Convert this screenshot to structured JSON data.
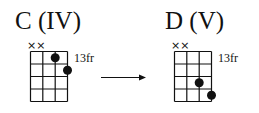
{
  "diagrams": [
    {
      "title": "C (IV)",
      "fret_label": "13fr",
      "muted": "××",
      "strings": 4,
      "frets": 4,
      "dots": [
        {
          "string": 3,
          "fret": 1
        },
        {
          "string": 4,
          "fret": 2
        }
      ]
    },
    {
      "title": "D (V)",
      "fret_label": "13fr",
      "muted": "××",
      "strings": 4,
      "frets": 4,
      "dots": [
        {
          "string": 3,
          "fret": 3
        },
        {
          "string": 4,
          "fret": 4
        }
      ]
    }
  ],
  "arrow": "→"
}
